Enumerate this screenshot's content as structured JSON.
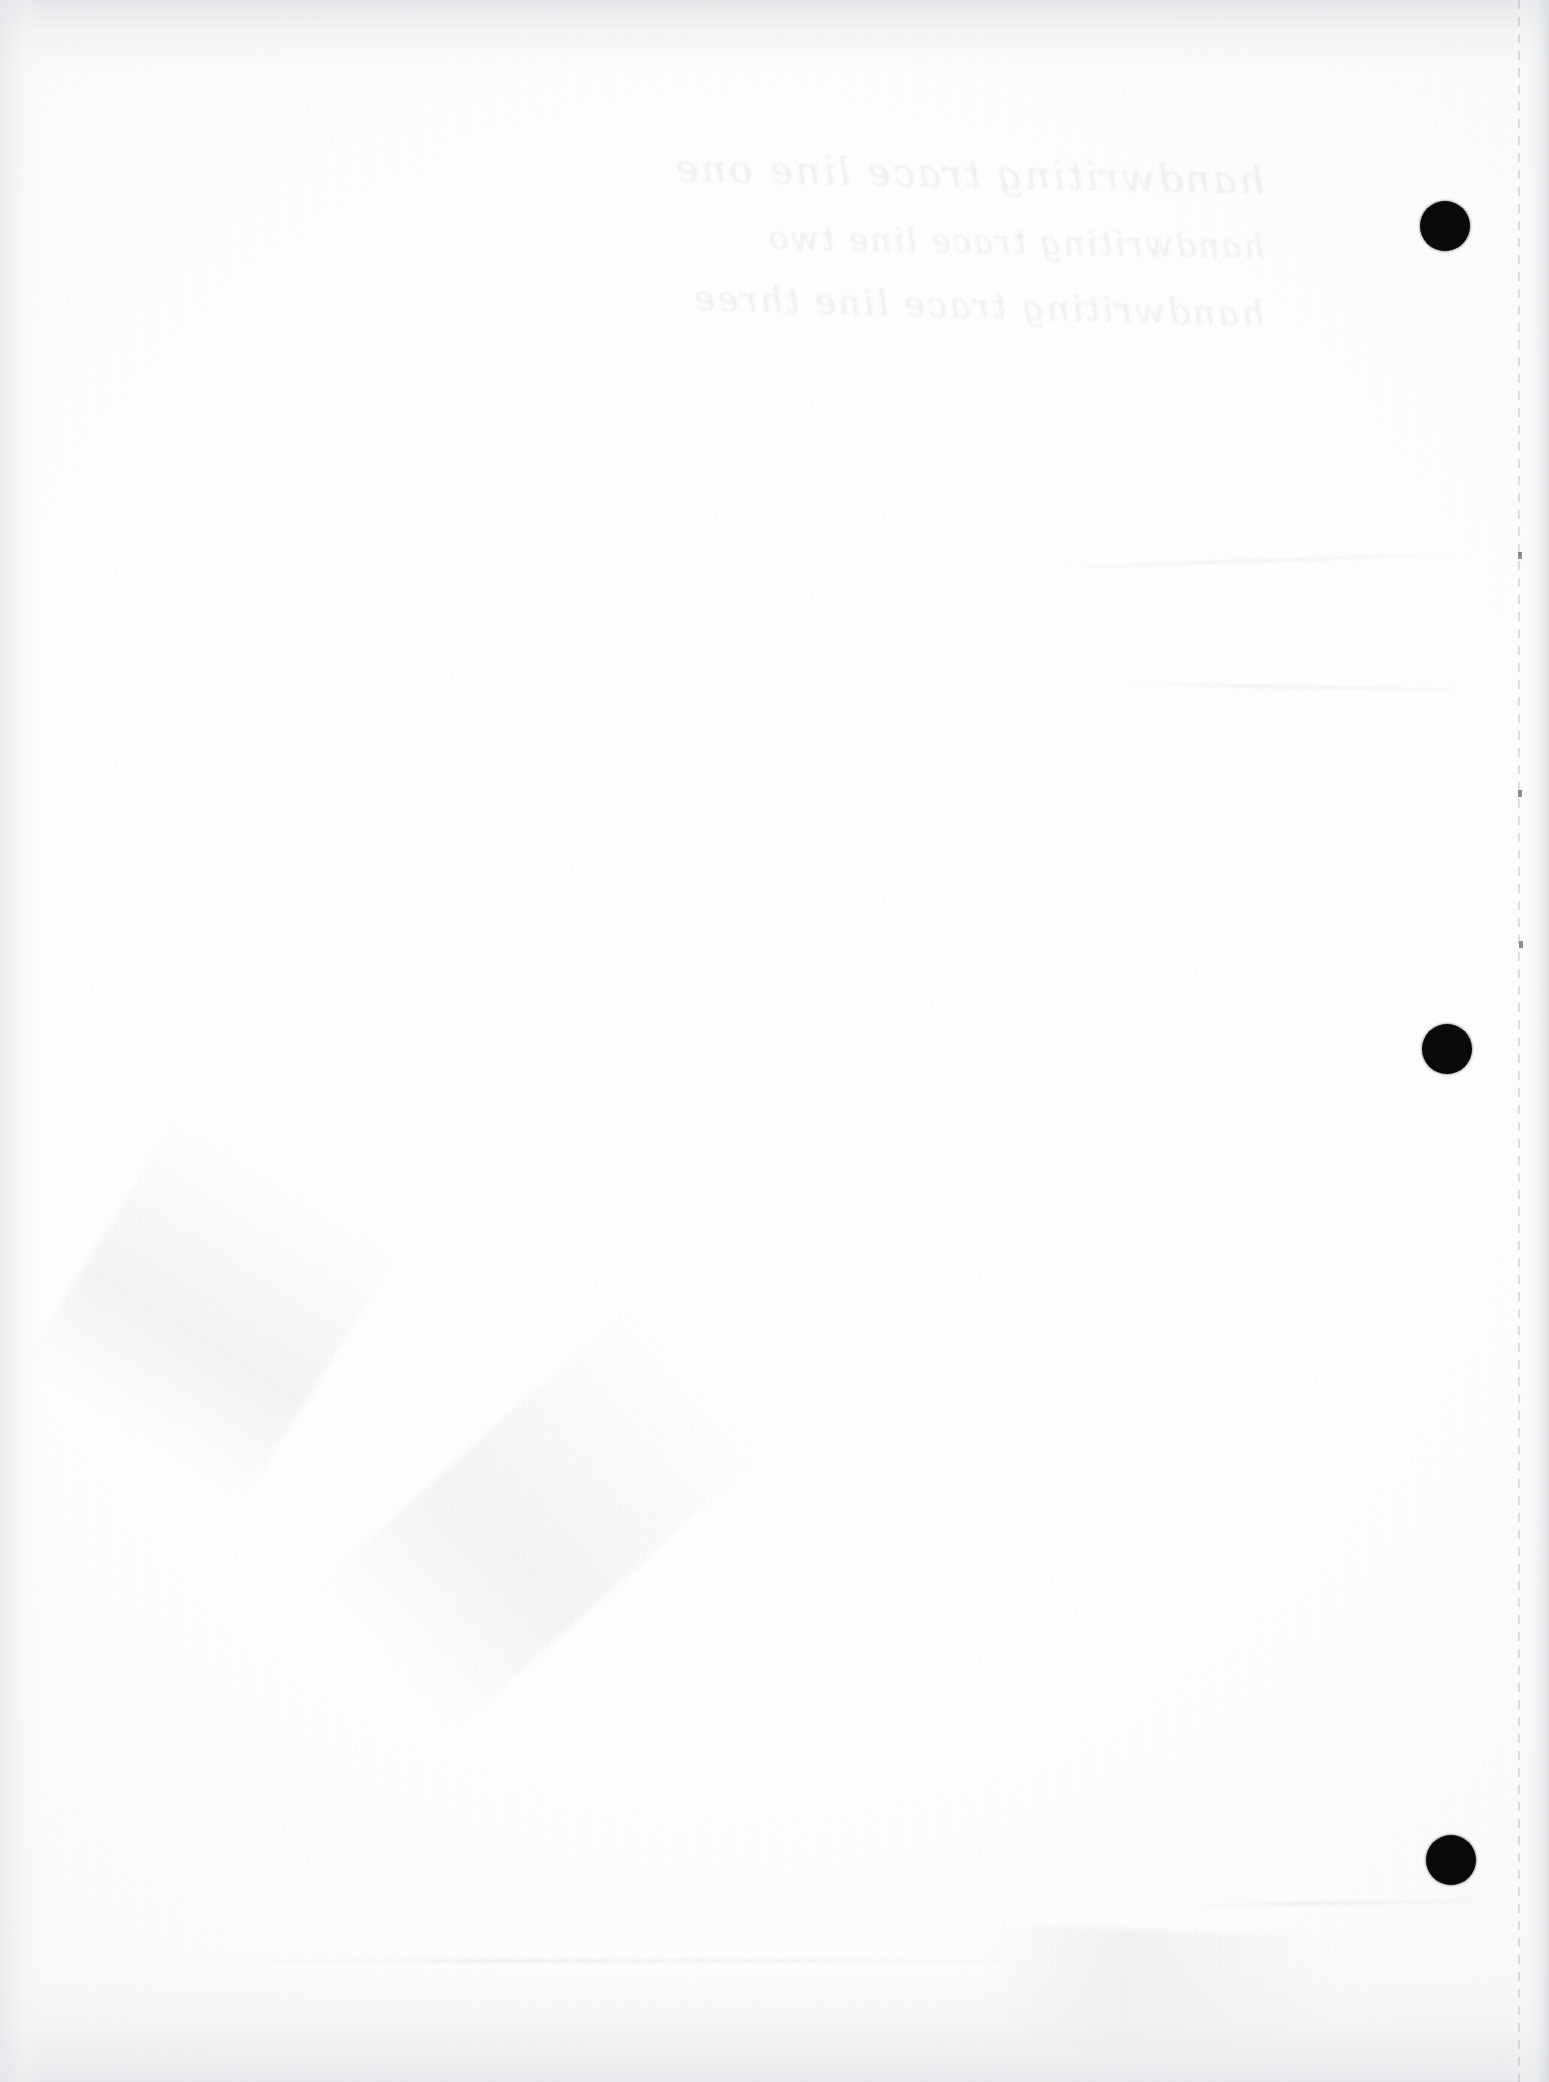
{
  "document": {
    "kind": "scanned-page",
    "description": "Blank scanned sheet of paper with three hole punches",
    "page_width": 1549,
    "page_height": 2082,
    "paper_color": "#fcfcfc",
    "ink_color": "#09090a",
    "edge_shade_color": "#e4e6e9",
    "visible_text": ""
  },
  "punch_holes": [
    {
      "name": "punch-hole-top",
      "cx": 1445,
      "cy": 226,
      "d": 50
    },
    {
      "name": "punch-hole-middle",
      "cx": 1447,
      "cy": 1049,
      "d": 50
    },
    {
      "name": "punch-hole-bottom",
      "cx": 1451,
      "cy": 1860,
      "d": 50
    }
  ],
  "page_edge": {
    "name": "page-edge-perforation",
    "x": 1518,
    "style": "dashed-vertical",
    "color": "#969aa0"
  },
  "edge_specks": [
    {
      "x": 1518,
      "y": 552
    },
    {
      "x": 1518,
      "y": 790
    },
    {
      "x": 1519,
      "y": 941
    }
  ],
  "showthrough": {
    "note": "faint illegible handwriting bled through from the reverse side",
    "lines": [
      "handwriting trace line one",
      "handwriting trace line two",
      "handwriting trace line three"
    ],
    "left": 630,
    "top": 150,
    "color": "#787c84"
  },
  "smudges": [
    {
      "name": "smudge-lower-left",
      "x": 60,
      "y": 1180,
      "w": 300,
      "h": 260,
      "rot": -58
    },
    {
      "name": "smudge-lower-center",
      "x": 330,
      "y": 1420,
      "w": 420,
      "h": 200,
      "rot": -42
    },
    {
      "name": "smudge-bottom-right",
      "x": 980,
      "y": 1930,
      "w": 360,
      "h": 120,
      "rot": 2
    }
  ],
  "creases": [
    {
      "name": "crease-upper-right",
      "x": 1040,
      "y": 560,
      "w": 430,
      "rot": -2
    },
    {
      "name": "crease-mid-right",
      "x": 1120,
      "y": 686,
      "w": 360,
      "rot": 1
    },
    {
      "name": "crease-lower-right",
      "x": 1180,
      "y": 1902,
      "w": 330,
      "rot": -1
    },
    {
      "name": "crease-bottom-band",
      "x": 180,
      "y": 1960,
      "w": 900,
      "rot": 0
    }
  ]
}
